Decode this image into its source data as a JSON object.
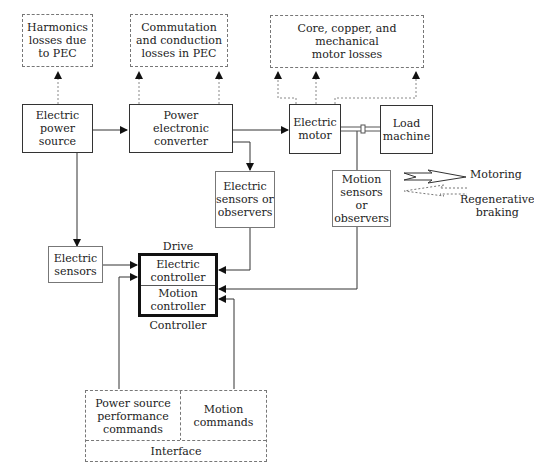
{
  "diagram": {
    "losses": {
      "harmonics": "Harmonics\nlosses due\nto PEC",
      "commutation": "Commutation\nand conduction\nlosses in PEC",
      "motor": "Core, copper, and mechanical\nmotor losses"
    },
    "blocks": {
      "power_source": "Electric\npower\nsource",
      "converter": "Power\nelectronic\nconverter",
      "motor": "Electric\nmotor",
      "load": "Load\nmachine",
      "electric_sensors_observers": "Electric\nsensors or\nobservers",
      "motion_sensors_observers": "Motion\nsensors or\nobservers",
      "electric_sensors": "Electric\nsensors"
    },
    "controller": {
      "top_label": "Drive",
      "electric": "Electric\ncontroller",
      "motion": "Motion\ncontroller",
      "bottom_label": "Controller"
    },
    "interface": {
      "power_commands": "Power source\nperformance\ncommands",
      "motion_commands": "Motion\ncommands",
      "label": "Interface"
    },
    "legend": {
      "motoring": "Motoring",
      "regen": "Regenerative\nbraking"
    }
  }
}
